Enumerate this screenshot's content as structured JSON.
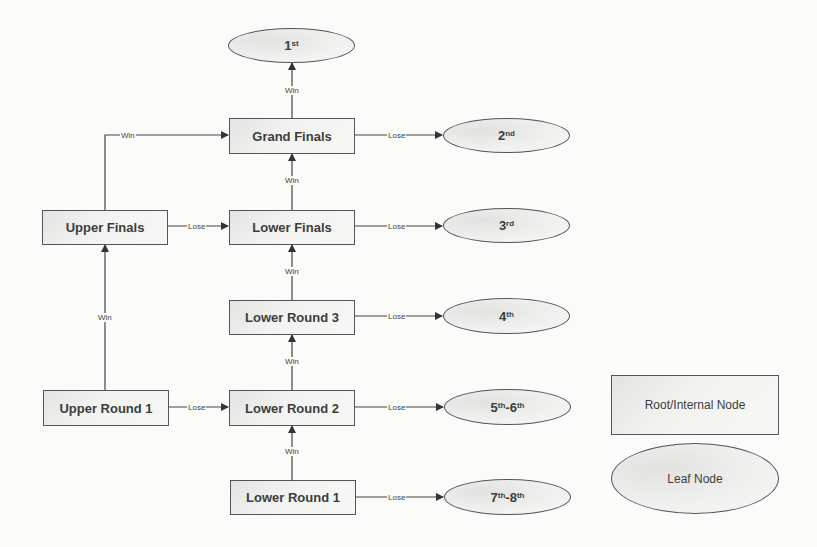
{
  "diagram": {
    "type": "tournament-bracket-tree",
    "internal_nodes": [
      {
        "id": "grand_finals",
        "label": "Grand Finals"
      },
      {
        "id": "upper_finals",
        "label": "Upper Finals"
      },
      {
        "id": "lower_finals",
        "label": "Lower Finals"
      },
      {
        "id": "lower_round_3",
        "label": "Lower Round 3"
      },
      {
        "id": "upper_round_1",
        "label": "Upper Round 1"
      },
      {
        "id": "lower_round_2",
        "label": "Lower Round 2"
      },
      {
        "id": "lower_round_1",
        "label": "Lower Round 1"
      }
    ],
    "leaf_nodes": [
      {
        "id": "p1",
        "num": "1",
        "sup": "st"
      },
      {
        "id": "p2",
        "num": "2",
        "sup": "nd"
      },
      {
        "id": "p3",
        "num": "3",
        "sup": "rd"
      },
      {
        "id": "p4",
        "num": "4",
        "sup": "th"
      },
      {
        "id": "p5_6",
        "num_a": "5",
        "sup_a": "th",
        "sep": "-",
        "num_b": "6",
        "sup_b": "th"
      },
      {
        "id": "p7_8",
        "num_a": "7",
        "sup_a": "th",
        "sep": "-",
        "num_b": "8",
        "sup_b": "th"
      }
    ],
    "edge_labels": {
      "win": "Win",
      "lose": "Lose"
    },
    "edges": [
      {
        "from": "grand_finals",
        "to": "p1",
        "label": "Win"
      },
      {
        "from": "grand_finals",
        "to": "p2",
        "label": "Lose"
      },
      {
        "from": "upper_finals",
        "to": "grand_finals",
        "label": "Win"
      },
      {
        "from": "upper_finals",
        "to": "lower_finals",
        "label": "Lose"
      },
      {
        "from": "lower_finals",
        "to": "grand_finals",
        "label": "Win"
      },
      {
        "from": "lower_finals",
        "to": "p3",
        "label": "Lose"
      },
      {
        "from": "lower_round_3",
        "to": "lower_finals",
        "label": "Win"
      },
      {
        "from": "lower_round_3",
        "to": "p4",
        "label": "Lose"
      },
      {
        "from": "upper_round_1",
        "to": "upper_finals",
        "label": "Win"
      },
      {
        "from": "upper_round_1",
        "to": "lower_round_2",
        "label": "Lose"
      },
      {
        "from": "lower_round_2",
        "to": "lower_round_3",
        "label": "Win"
      },
      {
        "from": "lower_round_2",
        "to": "p5_6",
        "label": "Lose"
      },
      {
        "from": "lower_round_1",
        "to": "lower_round_2",
        "label": "Win"
      },
      {
        "from": "lower_round_1",
        "to": "p7_8",
        "label": "Lose"
      }
    ],
    "legend": {
      "internal": "Root/Internal Node",
      "leaf": "Leaf Node"
    }
  }
}
